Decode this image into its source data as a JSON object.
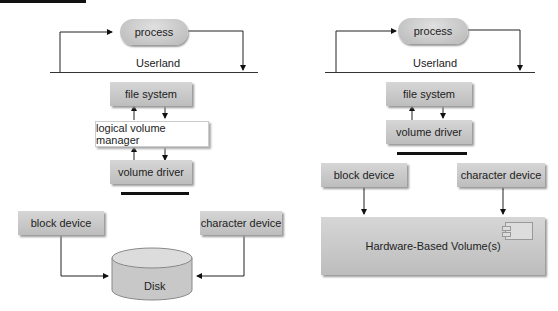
{
  "left": {
    "process": "process",
    "userland": "Userland",
    "file_system": "file system",
    "lvm": "logical volume manager",
    "volume_driver": "volume driver",
    "block_device": "block device",
    "character_device": "character device",
    "disk": "Disk"
  },
  "right": {
    "process": "process",
    "userland": "Userland",
    "file_system": "file system",
    "volume_driver": "volume driver",
    "block_device": "block device",
    "character_device": "character device",
    "hardware_volume": "Hardware-Based Volume(s)"
  }
}
